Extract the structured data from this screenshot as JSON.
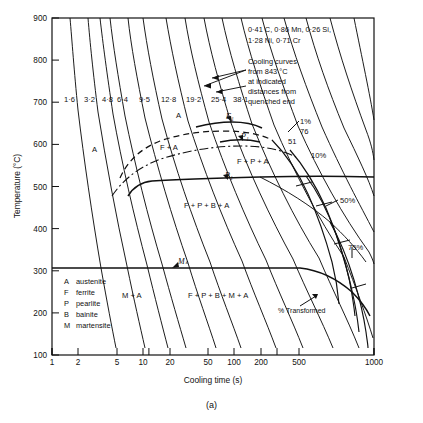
{
  "figure": {
    "caption": "(a)",
    "composition_line1": "0·41 C, 0·86 Mn, 0·26 Si,",
    "composition_line2": "1·28 Ni, 0·71 Cr",
    "note_line1": "Cooling curves",
    "note_line2": "from 843 °C",
    "note_line3": "at indicated",
    "note_line4": "distances from",
    "note_line5": "quenched end",
    "pct_transformed_label": "% Transformed"
  },
  "chart_data": {
    "type": "line",
    "xlabel": "Cooling time (s)",
    "ylabel": "Temperature (°C)",
    "xscale": "log",
    "xlim": [
      1,
      1000
    ],
    "ylim": [
      100,
      900
    ],
    "xticks": [
      "1",
      "2",
      "5",
      "10",
      "20",
      "50",
      "100",
      "200",
      "500",
      "1000"
    ],
    "xtick_values": [
      1,
      2,
      5,
      10,
      20,
      50,
      100,
      200,
      500,
      1000
    ],
    "yticks": [
      "100",
      "200",
      "300",
      "400",
      "500",
      "600",
      "700",
      "800",
      "900"
    ],
    "ytick_values": [
      100,
      200,
      300,
      400,
      500,
      600,
      700,
      800,
      900
    ],
    "grid": false,
    "legend_position": "lower-left-inside",
    "ms_temperature": 335,
    "austenitising_temperature": 843,
    "cooling_curve_labels": [
      "1·6",
      "3·2",
      "4·8",
      "6·4",
      "9·5",
      "12·8",
      "19·2",
      "25·4",
      "38·1"
    ],
    "hardness_labels": [
      "76",
      "51"
    ],
    "transformation_percent_labels": [
      "1%",
      "10%",
      "50%",
      "75%"
    ],
    "phase_region_labels": [
      "A",
      "A",
      "F + A",
      "F + P + A",
      "F + P + B + A",
      "M + A",
      "F + P + B + M + A"
    ],
    "curve_point_labels": [
      "F₁",
      "P₁",
      "B₁",
      "Mₛ"
    ],
    "legend": [
      {
        "symbol": "A",
        "name": "austenite"
      },
      {
        "symbol": "F",
        "name": "ferrite"
      },
      {
        "symbol": "P",
        "name": "pearlite"
      },
      {
        "symbol": "B",
        "name": "bainite"
      },
      {
        "symbol": "M",
        "name": "martensite"
      }
    ]
  }
}
